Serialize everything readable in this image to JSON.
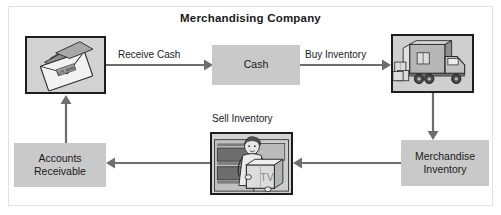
{
  "figure": {
    "title": "Merchandising Company",
    "background_color": "#ffffff",
    "frame_border_color": "#e3e3e3",
    "box_fill_color": "#c9c9c9",
    "arrow_color": "#6e6e6e",
    "picture_border_color": "#1d1d1d"
  },
  "nodes": [
    {
      "id": "receive-cash-image",
      "type": "image",
      "icon": "mail-envelope-with-cash-icon",
      "caption": ""
    },
    {
      "id": "cash",
      "type": "label-box",
      "label": "Cash"
    },
    {
      "id": "buy-inventory-image",
      "type": "image",
      "icon": "delivery-truck-icon",
      "caption": ""
    },
    {
      "id": "merchandise-inventory",
      "type": "label-box",
      "label_line1": "Merchandise",
      "label_line2": "Inventory"
    },
    {
      "id": "sell-inventory-image",
      "type": "image",
      "icon": "salesperson-carrying-box-icon",
      "caption": ""
    },
    {
      "id": "accounts-receivable",
      "type": "label-box",
      "label_line1": "Accounts",
      "label_line2": "Receivable"
    }
  ],
  "edges": [
    {
      "id": "receive-cash",
      "label": "Receive Cash",
      "from": "receive-cash-image",
      "to": "cash",
      "direction": "right"
    },
    {
      "id": "buy-inventory",
      "label": "Buy Inventory",
      "from": "cash",
      "to": "buy-inventory-image",
      "direction": "right"
    },
    {
      "id": "truck-to-inventory",
      "label": "",
      "from": "buy-inventory-image",
      "to": "merchandise-inventory",
      "direction": "down"
    },
    {
      "id": "inventory-to-sell",
      "label": "",
      "from": "merchandise-inventory",
      "to": "sell-inventory-image",
      "direction": "left"
    },
    {
      "id": "sell-inventory",
      "label": "Sell Inventory",
      "from": "sell-inventory-image",
      "to": "accounts-receivable",
      "direction": "left"
    },
    {
      "id": "ar-to-receive",
      "label": "",
      "from": "accounts-receivable",
      "to": "receive-cash-image",
      "direction": "up"
    }
  ],
  "labels": {
    "cash": "Cash",
    "accounts_receivable_line1": "Accounts",
    "accounts_receivable_line2": "Receivable",
    "merchandise_inventory_line1": "Merchandise",
    "merchandise_inventory_line2": "Inventory",
    "receive_cash": "Receive Cash",
    "buy_inventory": "Buy Inventory",
    "sell_inventory": "Sell Inventory",
    "envelope_text": "U.S. MAIL",
    "tv_box_text": "TV"
  }
}
